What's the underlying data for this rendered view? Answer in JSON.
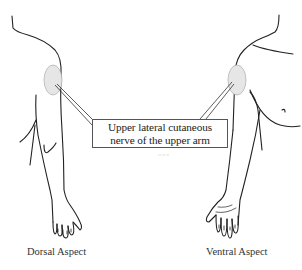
{
  "figure": {
    "callout_label": {
      "line1": "Upper lateral cutaneous",
      "line2": "nerve of the upper arm"
    },
    "captions": {
      "left": "Dorsal Aspect",
      "right": "Ventral Aspect"
    },
    "signature": "signature",
    "colors": {
      "line": "#222222",
      "patch_fill": "#e6e6e6",
      "patch_stroke": "#aaaaaa"
    }
  }
}
